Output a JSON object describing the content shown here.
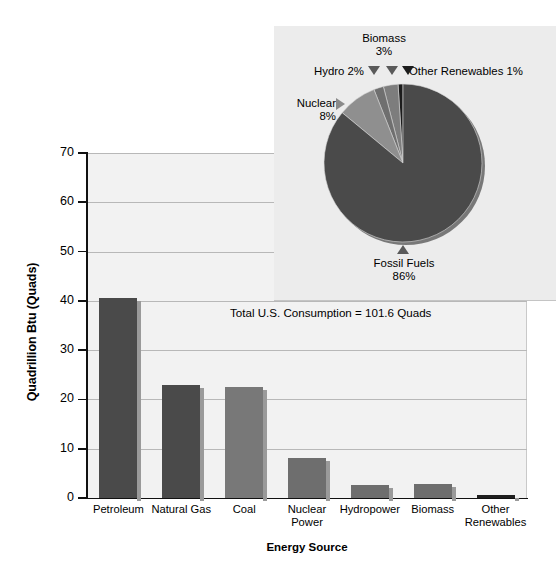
{
  "chart_data": [
    {
      "type": "bar",
      "title": "",
      "xlabel": "Energy Source",
      "ylabel": "Quadrillion Btu (Quads)",
      "categories": [
        "Petroleum",
        "Natural Gas",
        "Coal",
        "Nuclear Power",
        "Hydropower",
        "Biomass",
        "Other Renewables"
      ],
      "values": [
        40.5,
        23.0,
        22.5,
        8.2,
        2.7,
        2.9,
        0.7
      ],
      "bar_colors": [
        "#4a4a4a",
        "#4a4a4a",
        "#787878",
        "#6e6e6e",
        "#6e6e6e",
        "#6e6e6e",
        "#1f1f1f"
      ],
      "ylim": [
        0,
        70
      ],
      "ytick_labels": [
        "0",
        "10",
        "20",
        "30",
        "40",
        "50",
        "60",
        "70"
      ],
      "ytick_values": [
        0,
        10,
        20,
        30,
        40,
        50,
        60,
        70
      ],
      "grid": true,
      "legend": "none",
      "annotations": [
        "Total U.S. Consumption = 101.6 Quads"
      ]
    },
    {
      "type": "pie",
      "title": "",
      "labels": [
        "Fossil Fuels",
        "Nuclear",
        "Hydro",
        "Biomass",
        "Other Renewables"
      ],
      "values": [
        86,
        8,
        2,
        3,
        1
      ],
      "value_labels": [
        "86%",
        "8%",
        "2%",
        "3%",
        "1%"
      ],
      "slice_colors": [
        "#4a4a4a",
        "#8f8f8f",
        "#6f6f6f",
        "#7d7d7d",
        "#1c1c1c"
      ],
      "legend": "callout-labels"
    }
  ],
  "bar_chart": {
    "y_axis": {
      "title": "Quadrillion Btu (Quads)",
      "ticks": [
        {
          "label": "70",
          "value": 70
        },
        {
          "label": "60",
          "value": 60
        },
        {
          "label": "50",
          "value": 50
        },
        {
          "label": "40",
          "value": 40
        },
        {
          "label": "30",
          "value": 30
        },
        {
          "label": "20",
          "value": 20
        },
        {
          "label": "10",
          "value": 10
        },
        {
          "label": "0",
          "value": 0
        }
      ]
    },
    "x_axis": {
      "title": "Energy Source"
    },
    "bars": [
      {
        "label": "Petroleum",
        "value": 40.5,
        "color": "#4a4a4a"
      },
      {
        "label": "Natural Gas",
        "value": 23.0,
        "color": "#4a4a4a"
      },
      {
        "label": "Coal",
        "value": 22.5,
        "color": "#787878"
      },
      {
        "label": "Nuclear\nPower",
        "value": 8.2,
        "color": "#6e6e6e"
      },
      {
        "label": "Hydropower",
        "value": 2.7,
        "color": "#6e6e6e"
      },
      {
        "label": "Biomass",
        "value": 2.9,
        "color": "#6e6e6e"
      },
      {
        "label": "Other\nRenewables",
        "value": 0.7,
        "color": "#1f1f1f"
      }
    ],
    "annotation": "Total U.S. Consumption = 101.6 Quads"
  },
  "pie_chart": {
    "labels": {
      "biomass_name": "Biomass",
      "biomass_value": "3%",
      "hydro": "Hydro 2%",
      "other_renewables": "Other Renewables 1%",
      "nuclear_name": "Nuclear",
      "nuclear_value": "8%",
      "fossil_name": "Fossil Fuels",
      "fossil_value": "86%"
    }
  },
  "colors": {
    "plot_background": "#f2f2f2",
    "inset_background": "#ececec",
    "gridline": "#b8b8b8",
    "axis": "#111111",
    "bar_dark": "#4a4a4a",
    "bar_mid": "#6e6e6e",
    "bar_light": "#787878",
    "bar_darkest": "#1f1f1f"
  }
}
